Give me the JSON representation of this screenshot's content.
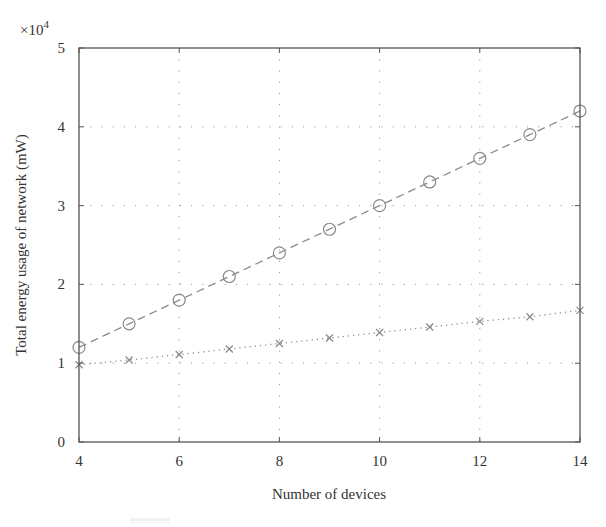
{
  "chart_data": {
    "type": "line",
    "title": "",
    "xlabel": "Number of devices",
    "ylabel": "Total energy usage of network (mW)",
    "y_multiplier_label": "×10",
    "y_multiplier_exp": "4",
    "xlim": [
      4,
      14
    ],
    "ylim": [
      0,
      5
    ],
    "y_scale": 10000,
    "x_ticks": [
      4,
      6,
      8,
      10,
      12,
      14
    ],
    "y_ticks": [
      0,
      1,
      2,
      3,
      4,
      5
    ],
    "grid": true,
    "legend": null,
    "x": [
      4,
      5,
      6,
      7,
      8,
      9,
      10,
      11,
      12,
      13,
      14
    ],
    "series": [
      {
        "name": "circle-dashed",
        "marker": "circle",
        "line": "dashed",
        "color": "#8a8a8a",
        "values": [
          12000,
          15000,
          18000,
          21000,
          24000,
          27000,
          30000,
          33000,
          36000,
          39000,
          42000
        ]
      },
      {
        "name": "cross-dotted",
        "marker": "x",
        "line": "dotted",
        "color": "#8a8a8a",
        "values": [
          9800,
          10400,
          11100,
          11800,
          12500,
          13200,
          13900,
          14600,
          15300,
          15900,
          16700
        ]
      }
    ]
  },
  "layout": {
    "plot_left": 79,
    "plot_right": 580,
    "plot_top": 48,
    "plot_bottom": 442,
    "axis_color": "#555555",
    "grid_color": "#9a9a9a"
  }
}
